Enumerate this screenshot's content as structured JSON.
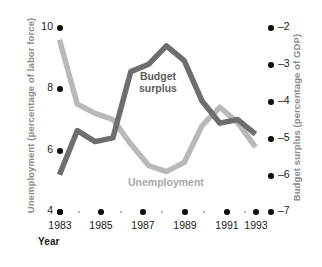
{
  "chart_data": {
    "type": "line",
    "title": "",
    "xlabel": "Year",
    "x": [
      1983,
      1984,
      1985,
      1986,
      1987,
      1988,
      1989,
      1990,
      1991,
      1992,
      1993,
      1994
    ],
    "xtick_labels": [
      "1983",
      "1985",
      "1987",
      "1989",
      "1991",
      "1993"
    ],
    "xtick_values": [
      1983,
      1985,
      1987,
      1989,
      1991,
      1993
    ],
    "grid": false,
    "legend_position": "inline-annotations",
    "axes": [
      {
        "id": "left",
        "label": "Unemployment (percentage of labor force)",
        "ticks": [
          10,
          8,
          6,
          4
        ],
        "tick_labels": [
          "10",
          "8",
          "6",
          "4"
        ],
        "ylim": [
          4,
          10.6
        ]
      },
      {
        "id": "right",
        "label": "Budget surplus (percentage of GDP)",
        "ticks": [
          -2,
          -3,
          -4,
          -5,
          -6,
          -7
        ],
        "tick_labels": [
          "–2",
          "–3",
          "–4",
          "–5",
          "–6",
          "–7"
        ],
        "ylim": [
          -7.35,
          -1.75
        ]
      }
    ],
    "series": [
      {
        "name": "Unemployment",
        "axis": "left",
        "color": "#b9b9b9",
        "annotation": "Unemployment",
        "values": [
          9.6,
          7.5,
          7.2,
          7.0,
          6.2,
          5.5,
          5.3,
          5.6,
          6.8,
          7.4,
          6.9,
          6.1
        ]
      },
      {
        "name": "Budget surplus",
        "axis": "right",
        "color": "#6e6e6e",
        "annotation": "Budget surplus",
        "values": [
          -6.0,
          -4.8,
          -5.1,
          -5.0,
          -3.2,
          -3.0,
          -2.5,
          -2.9,
          -4.0,
          -4.6,
          -4.5,
          -4.9
        ]
      }
    ]
  }
}
